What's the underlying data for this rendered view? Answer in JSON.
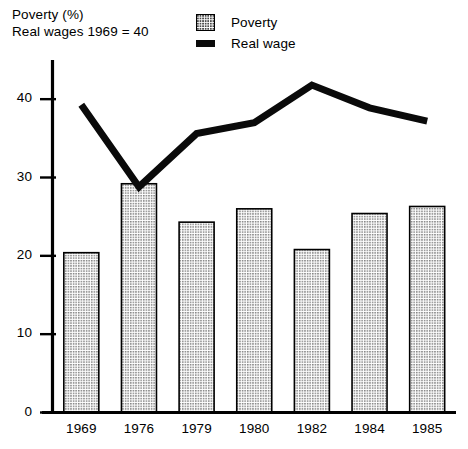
{
  "chart": {
    "title_lines": [
      "Poverty (%)",
      "Real wages 1969 = 40"
    ],
    "legend": [
      {
        "label": "Poverty",
        "swatch": "stippled-bar-swatch"
      },
      {
        "label": "Real wage",
        "swatch": "solid-line-swatch"
      }
    ]
  },
  "chart_data": {
    "type": "bar",
    "subtitle": "Real wages 1969 = 40",
    "xlabel": "",
    "ylabel": "",
    "categories": [
      "1969",
      "1976",
      "1979",
      "1980",
      "1982",
      "1984",
      "1985"
    ],
    "ylim": [
      0,
      45
    ],
    "yticks": [
      0,
      10,
      20,
      30,
      40
    ],
    "ytick_labels": [
      "0",
      "10",
      "20",
      "30",
      "40"
    ],
    "grid": false,
    "legend_position": "top-center",
    "series": [
      {
        "name": "Poverty",
        "type": "bar",
        "style": "stippled-fill-black-outline",
        "values": [
          20.4,
          29.2,
          24.3,
          26.0,
          20.8,
          25.4,
          26.3
        ]
      },
      {
        "name": "Real wage",
        "type": "line",
        "style": "thick-solid-black",
        "values": [
          39.3,
          28.8,
          35.6,
          37.0,
          41.8,
          38.9,
          37.2
        ]
      }
    ]
  }
}
